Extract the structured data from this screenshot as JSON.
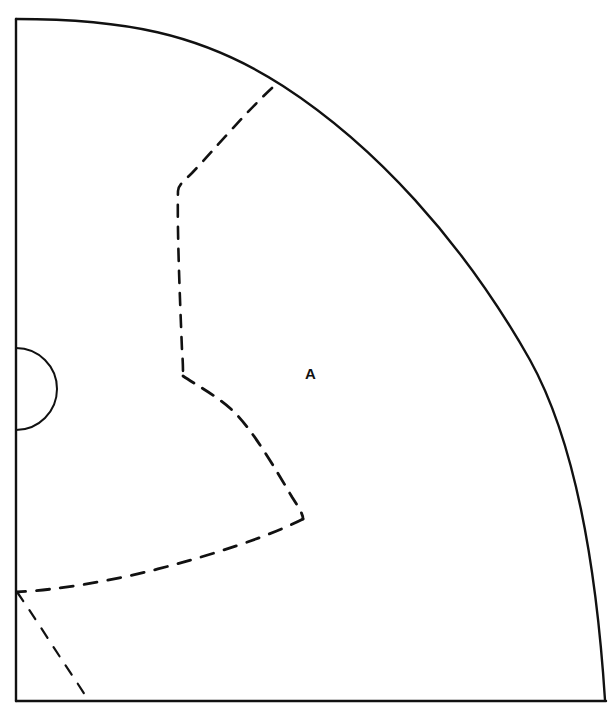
{
  "figure": {
    "type": "technical-line-drawing",
    "background_color": "#ffffff",
    "line_color": "#111111",
    "solid_stroke_width": 2.4,
    "dashed_stroke_width": 2.6,
    "dash_pattern": "12 10",
    "canvas": {
      "width": 611,
      "height": 717
    }
  },
  "labels": [
    {
      "id": "region-a",
      "text": "A",
      "x": 310,
      "y": 373,
      "bold": true,
      "font_size": 15,
      "color": "#111111"
    }
  ],
  "geometry": {
    "left_edge": {
      "name": "left-boundary-line",
      "x1": 16,
      "y1": 19,
      "x2": 16,
      "y2": 701
    },
    "bottom_edge": {
      "name": "bottom-boundary-line",
      "x1": 16,
      "y1": 701,
      "x2": 606,
      "y2": 701
    },
    "outer_arc": {
      "name": "outer-arc",
      "start": [
        16,
        19
      ],
      "end": [
        605,
        700
      ],
      "path": "M 16 19 C 120 19 200 32 283 86 C 374 145 462 240 530 360 C 570 432 595 545 605 700"
    },
    "semicircle_notch": {
      "name": "semicircle-notch",
      "center": [
        16,
        389
      ],
      "radius": 41,
      "bulge_direction": "right",
      "path": "M 16 348 A 41 41 0 0 1 16 430"
    },
    "dashed_contours": [
      {
        "id": "contour-upper",
        "name": "dashed-contour-upper",
        "path": "M 272 88 C 246 112 212 152 192 173 C 184 181 178 185 178 191 C 177 230 180 300 182 350 C 183 362 183 370 183 376"
      },
      {
        "id": "contour-mid",
        "name": "dashed-contour-middle",
        "path": "M 183 376 C 196 385 214 394 231 409 C 252 428 276 470 292 497 C 299 508 303 514 303 519"
      },
      {
        "id": "contour-lower",
        "name": "dashed-contour-lower",
        "path": "M 303 519 C 270 536 210 556 150 571 C 105 582 56 590 17 592"
      },
      {
        "id": "contour-corner",
        "name": "dashed-contour-corner",
        "path": "M 17 592 C 32 613 55 650 72 675 C 80 687 85 695 89 701"
      }
    ]
  }
}
